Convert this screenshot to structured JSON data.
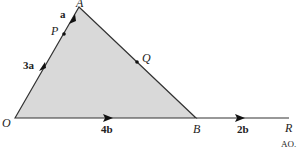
{
  "diagram": {
    "points": {
      "O": "O",
      "A": "A",
      "B": "B",
      "R": "R",
      "P": "P",
      "Q": "Q"
    },
    "vectors": {
      "OP": "3a",
      "PA": "a",
      "OB": "4b",
      "BR": "2b"
    },
    "footer": "AO.",
    "colors": {
      "fill": "#d9d9d9",
      "line": "#333333"
    }
  }
}
